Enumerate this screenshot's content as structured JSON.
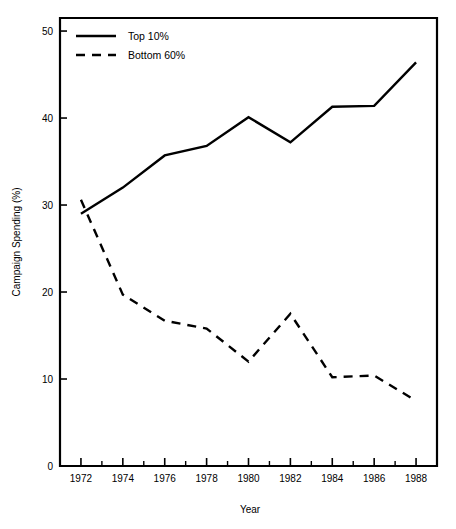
{
  "chart_data": {
    "type": "line",
    "title": "",
    "xlabel": "Year",
    "ylabel": "Campaign Spending (%)",
    "x": [
      1972,
      1974,
      1976,
      1978,
      1980,
      1982,
      1984,
      1986,
      1988
    ],
    "xlim": [
      1971,
      1989
    ],
    "ylim": [
      0,
      51.5
    ],
    "xticks": [
      1972,
      1974,
      1976,
      1978,
      1980,
      1982,
      1984,
      1986,
      1988
    ],
    "xtick_labels": [
      "1972",
      "1974",
      "1976",
      "1978",
      "1980",
      "1982",
      "1984",
      "1986",
      "1988"
    ],
    "xticks_minor": [
      1973,
      1975,
      1977,
      1979,
      1981,
      1983,
      1985,
      1987
    ],
    "yticks": [
      0,
      10,
      20,
      30,
      40,
      50
    ],
    "ytick_labels": [
      "0",
      "10",
      "20",
      "30",
      "40",
      "50"
    ],
    "grid": false,
    "legend_position": "top-left",
    "series": [
      {
        "name": "Top 10%",
        "style": "solid",
        "color": "#000000",
        "values": [
          29.0,
          32.0,
          35.7,
          36.8,
          40.1,
          37.2,
          41.3,
          41.4,
          46.4
        ]
      },
      {
        "name": "Bottom 60%",
        "style": "dashed",
        "color": "#000000",
        "values": [
          30.6,
          19.7,
          16.7,
          15.8,
          12.0,
          17.5,
          10.2,
          10.4,
          7.5
        ]
      }
    ]
  },
  "legend": {
    "items": [
      {
        "label": "Top 10%",
        "style": "solid"
      },
      {
        "label": "Bottom 60%",
        "style": "dashed"
      }
    ]
  },
  "axes": {
    "x_title": "Year",
    "y_title": "Campaign Spending (%)"
  }
}
